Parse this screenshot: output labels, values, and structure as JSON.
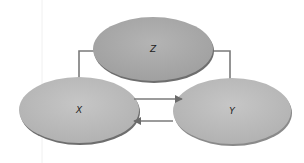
{
  "diagram": {
    "type": "causal-graph",
    "nodes": [
      {
        "id": "Z",
        "label": "Z",
        "cx": 153,
        "cy": 49,
        "rx": 60,
        "ry": 32,
        "fill": "#a9a9a9"
      },
      {
        "id": "X",
        "label": "X",
        "cx": 79,
        "cy": 110,
        "rx": 60,
        "ry": 33,
        "fill": "#bdbdbd"
      },
      {
        "id": "Y",
        "label": "Y",
        "cx": 232,
        "cy": 111,
        "rx": 59,
        "ry": 33,
        "fill": "#bdbdbd"
      }
    ],
    "edges": [
      {
        "from": "Z",
        "to": "X"
      },
      {
        "from": "Z",
        "to": "Y"
      },
      {
        "from": "X",
        "to": "Y"
      },
      {
        "from": "Y",
        "to": "X"
      }
    ],
    "colors": {
      "edge": "#7a7a7a",
      "shadow": "#6e6e6e",
      "guide_line": "#f0f0f0"
    }
  }
}
